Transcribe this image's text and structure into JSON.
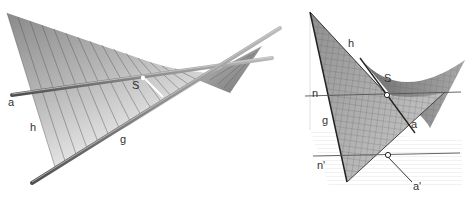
{
  "left_figure": {
    "title": "Hyperbolic paraboloid with rulings",
    "labels": {
      "a": "a",
      "h": "h",
      "g": "g",
      "S": "S"
    }
  },
  "right_figure": {
    "title": "Hyperbolic paraboloid grid with projections",
    "labels": {
      "h": "h",
      "S": "S",
      "n": "n",
      "g": "g",
      "a": "a",
      "n_prime": "n'",
      "a_prime": "a'"
    }
  },
  "colors": {
    "surface_dark": "#7a7a7a",
    "surface_light": "#f2f2f2",
    "rod": "#6a6a6a",
    "line": "#444444",
    "grid_plane": "#d8d8d8"
  }
}
